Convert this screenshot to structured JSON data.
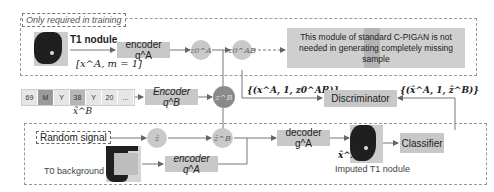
{
  "training_region": {
    "label": "Only required in training"
  },
  "top_row": {
    "t1_nodule_label": "T1 nodule",
    "input_formula": "[x^A, m = 1]",
    "encoder_a_label": "encoder q^A",
    "z0a_label": "z0^A",
    "z0ab_label": "z0^AB",
    "note": "This module of standard C-PIGAN is not needed in generating completely missing sample"
  },
  "mask_row": {
    "cells": [
      "69",
      "M",
      "Y",
      "38",
      "Y",
      "20",
      "..."
    ],
    "label": "x̃^B",
    "encoder_b_label": "Encoder q^B",
    "zb_label": "z^B"
  },
  "discriminator": {
    "label": "Discriminator",
    "real_input": "{(x^A, 1, z0^AB)}",
    "fake_input": "{(x̂^A, 1, ẑ^B)}"
  },
  "bottom_row": {
    "random_signal": "Random signal",
    "z_hat": "ẑ",
    "z_hat_b": "ẑ^B",
    "t0_label": "T0 background",
    "encoder_a_label": "encoder q^A",
    "decoder_label": "decoder g^A",
    "imputed_symbol": "x̂^A",
    "imputed_label": "Imputed T1 nodule",
    "classifier_label": "Classifier"
  }
}
